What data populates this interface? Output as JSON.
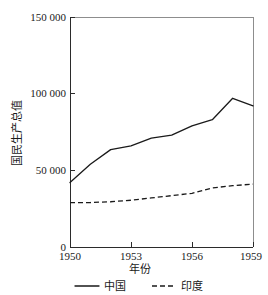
{
  "chart_data": {
    "type": "line",
    "title": "",
    "xlabel": "年份",
    "ylabel": "国民生产总值",
    "x": [
      1950,
      1951,
      1952,
      1953,
      1954,
      1955,
      1956,
      1957,
      1958,
      1959
    ],
    "xlim": [
      1950,
      1959
    ],
    "ylim": [
      0,
      150000
    ],
    "xticks": [
      1950,
      1953,
      1956,
      1959
    ],
    "xtick_labels": [
      "1950",
      "1953",
      "1956",
      "1959"
    ],
    "yticks": [
      0,
      50000,
      100000,
      150000
    ],
    "ytick_labels": [
      "0",
      "50 000",
      "100 000",
      "150 000"
    ],
    "grid": false,
    "legend_position": "below",
    "series": [
      {
        "name": "中国",
        "style": "solid",
        "color": "#1a1a1a",
        "values": [
          42000,
          54000,
          63500,
          66000,
          71000,
          73000,
          79000,
          83000,
          97000,
          92000
        ]
      },
      {
        "name": "印度",
        "style": "dashed",
        "color": "#1a1a1a",
        "values": [
          29000,
          29000,
          29500,
          30500,
          32000,
          33500,
          35000,
          38500,
          40000,
          41000
        ]
      }
    ]
  },
  "legend": {
    "items": [
      {
        "label": "中国",
        "style": "solid"
      },
      {
        "label": "印度",
        "style": "dashed"
      }
    ]
  }
}
